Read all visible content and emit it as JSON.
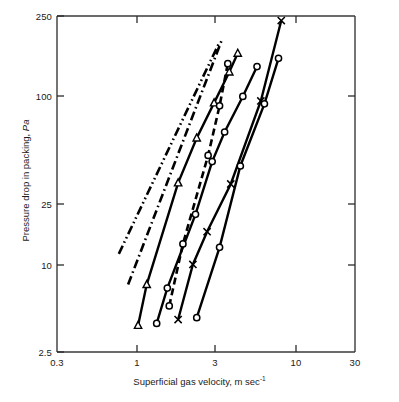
{
  "figure": {
    "name": "pressure-drop-vs-superficial-gas-velocity-loglog-chart"
  },
  "axes": {
    "x_title_main": "Superficial gas velocity, m sec",
    "x_title_sup": "-1",
    "y_title_main": "Pressure drop in packing, ",
    "y_title_unit": "Pa",
    "x_ticks": [
      "0.3",
      "1",
      "3",
      "10",
      "30"
    ],
    "y_ticks": [
      "250",
      "100",
      "25",
      "10",
      "2.5"
    ]
  },
  "chart_data": {
    "type": "line",
    "title": "",
    "xlabel": "Superficial gas velocity, m sec^-1",
    "ylabel": "Pressure drop in packing, Pa",
    "xscale": "log",
    "yscale": "log",
    "xlim": [
      0.3,
      30
    ],
    "ylim": [
      2.5,
      250
    ],
    "xticks": [
      0.3,
      1,
      3,
      10,
      30
    ],
    "yticks": [
      2.5,
      10,
      25,
      100,
      250
    ],
    "grid": false,
    "legend": "none",
    "series": [
      {
        "name": "series-1",
        "linestyle": "dash-dot-dot",
        "marker": "none",
        "x": [
          0.78,
          3.7
        ],
        "y": [
          9.6,
          175.0
        ]
      },
      {
        "name": "series-2",
        "linestyle": "dash-dot",
        "marker": "none",
        "x": [
          0.9,
          3.85
        ],
        "y": [
          6.3,
          182.0
        ]
      },
      {
        "name": "series-3",
        "linestyle": "solid",
        "marker": "triangle",
        "x": [
          1.05,
          1.2,
          1.95,
          2.6,
          3.4,
          4.3,
          4.9
        ],
        "y": [
          3.6,
          6.3,
          25.4,
          47.0,
          76.0,
          116.0,
          150.0
        ]
      },
      {
        "name": "series-4",
        "linestyle": "solid",
        "marker": "circle",
        "x": [
          1.4,
          1.65,
          2.55,
          3.3,
          4.0,
          5.3,
          6.6
        ],
        "y": [
          3.7,
          6.0,
          16.5,
          34.0,
          51.0,
          83.0,
          125.0
        ]
      },
      {
        "name": "series-5",
        "linestyle": "dashed",
        "marker": "circle",
        "x": [
          1.7,
          2.1,
          3.1,
          3.7,
          4.2
        ],
        "y": [
          4.7,
          11.0,
          37.0,
          73.0,
          130.0
        ]
      },
      {
        "name": "series-6",
        "linestyle": "solid",
        "marker": "x",
        "x": [
          1.95,
          2.45,
          3.05,
          4.4,
          7.0,
          9.6
        ],
        "y": [
          3.9,
          8.3,
          13.0,
          25.0,
          78.0,
          235.0
        ]
      },
      {
        "name": "series-7",
        "linestyle": "solid",
        "marker": "circle",
        "x": [
          2.6,
          3.7,
          5.1,
          7.4,
          9.2
        ],
        "y": [
          4.0,
          10.5,
          32.0,
          75.0,
          140.0
        ]
      }
    ]
  }
}
